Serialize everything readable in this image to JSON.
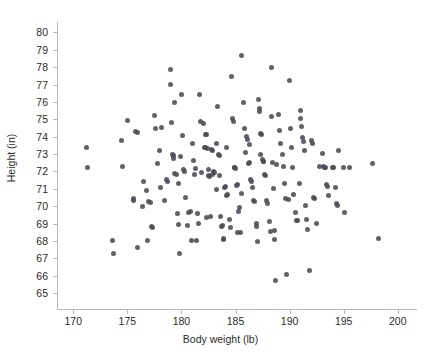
{
  "chart_data": {
    "type": "scatter",
    "title": "",
    "xlabel": "Body weight (lb)",
    "ylabel": "Height (in)",
    "xlim": [
      168.5,
      201.5
    ],
    "ylim": [
      64.2,
      80.6
    ],
    "xticks": [
      170,
      175,
      180,
      185,
      190,
      195,
      200
    ],
    "yticks": [
      65,
      66,
      67,
      68,
      69,
      70,
      71,
      72,
      73,
      74,
      75,
      76,
      77,
      78,
      79,
      80
    ],
    "grid": false,
    "legend": null,
    "marker_color": "#4b4b55",
    "axis_color": "#b9b9bd",
    "background": "#ffffff",
    "n_points": 201,
    "points": [
      [
        171.2,
        73.4
      ],
      [
        171.3,
        72.2
      ],
      [
        173.6,
        68.0
      ],
      [
        173.7,
        67.25
      ],
      [
        174.5,
        73.8
      ],
      [
        174.6,
        72.3
      ],
      [
        175.0,
        74.95
      ],
      [
        175.6,
        70.45
      ],
      [
        175.6,
        70.3
      ],
      [
        175.8,
        74.3
      ],
      [
        175.9,
        74.25
      ],
      [
        175.9,
        67.65
      ],
      [
        176.4,
        70.0
      ],
      [
        176.5,
        71.4
      ],
      [
        176.8,
        70.9
      ],
      [
        176.9,
        68.0
      ],
      [
        177.0,
        70.25
      ],
      [
        177.1,
        70.2
      ],
      [
        177.2,
        68.85
      ],
      [
        177.3,
        68.75
      ],
      [
        177.5,
        75.2
      ],
      [
        177.8,
        72.45
      ],
      [
        178.0,
        73.2
      ],
      [
        178.1,
        71.05
      ],
      [
        178.2,
        74.55
      ],
      [
        178.4,
        70.3
      ],
      [
        178.6,
        71.55
      ],
      [
        178.7,
        71.45
      ],
      [
        179.0,
        77.85
      ],
      [
        179.0,
        77.0
      ],
      [
        179.1,
        74.8
      ],
      [
        179.2,
        73.0
      ],
      [
        179.3,
        72.9
      ],
      [
        179.3,
        72.75
      ],
      [
        179.4,
        75.95
      ],
      [
        179.4,
        71.9
      ],
      [
        179.5,
        71.85
      ],
      [
        179.6,
        69.6
      ],
      [
        179.7,
        68.95
      ],
      [
        179.7,
        71.3
      ],
      [
        179.8,
        67.25
      ],
      [
        180.0,
        76.4
      ],
      [
        180.1,
        74.05
      ],
      [
        180.2,
        72.1
      ],
      [
        180.3,
        72.0
      ],
      [
        180.4,
        70.5
      ],
      [
        180.6,
        68.9
      ],
      [
        180.7,
        69.65
      ],
      [
        180.8,
        69.7
      ],
      [
        181.0,
        73.6
      ],
      [
        181.1,
        72.65
      ],
      [
        181.2,
        71.8
      ],
      [
        181.3,
        72.15
      ],
      [
        181.4,
        68.05
      ],
      [
        181.5,
        69.6
      ],
      [
        181.6,
        69.0
      ],
      [
        181.7,
        76.45
      ],
      [
        181.8,
        74.85
      ],
      [
        182.0,
        74.75
      ],
      [
        182.1,
        73.4
      ],
      [
        182.2,
        73.35
      ],
      [
        182.2,
        74.1
      ],
      [
        182.3,
        74.15
      ],
      [
        182.4,
        73.3
      ],
      [
        182.5,
        72.1
      ],
      [
        182.5,
        71.75
      ],
      [
        182.6,
        71.7
      ],
      [
        182.7,
        69.4
      ],
      [
        182.8,
        73.25
      ],
      [
        182.9,
        73.2
      ],
      [
        183.0,
        72.0
      ],
      [
        183.1,
        71.95
      ],
      [
        183.2,
        73.6
      ],
      [
        183.3,
        75.75
      ],
      [
        183.4,
        73.0
      ],
      [
        183.5,
        72.9
      ],
      [
        183.6,
        69.4
      ],
      [
        183.7,
        68.85
      ],
      [
        183.8,
        68.9
      ],
      [
        183.9,
        68.1
      ],
      [
        183.9,
        68.15
      ],
      [
        184.0,
        71.1
      ],
      [
        184.1,
        71.15
      ],
      [
        184.2,
        70.6
      ],
      [
        184.3,
        70.7
      ],
      [
        184.4,
        69.25
      ],
      [
        184.5,
        68.75
      ],
      [
        184.6,
        77.45
      ],
      [
        184.7,
        75.05
      ],
      [
        184.8,
        74.9
      ],
      [
        184.9,
        72.25
      ],
      [
        185.0,
        72.15
      ],
      [
        185.1,
        71.2
      ],
      [
        185.2,
        71.25
      ],
      [
        185.3,
        69.7
      ],
      [
        185.4,
        69.9
      ],
      [
        185.5,
        68.5
      ],
      [
        185.6,
        78.65
      ],
      [
        185.7,
        75.95
      ],
      [
        185.8,
        74.45
      ],
      [
        185.9,
        73.1
      ],
      [
        186.0,
        74.0
      ],
      [
        186.1,
        73.85
      ],
      [
        186.2,
        72.45
      ],
      [
        186.3,
        72.5
      ],
      [
        186.4,
        71.55
      ],
      [
        186.5,
        71.4
      ],
      [
        186.6,
        71.1
      ],
      [
        186.7,
        70.35
      ],
      [
        186.8,
        70.25
      ],
      [
        186.9,
        68.85
      ],
      [
        187.0,
        67.95
      ],
      [
        187.1,
        76.15
      ],
      [
        187.2,
        75.6
      ],
      [
        187.2,
        75.45
      ],
      [
        187.3,
        74.2
      ],
      [
        187.4,
        74.1
      ],
      [
        187.5,
        72.7
      ],
      [
        187.6,
        72.6
      ],
      [
        187.6,
        72.55
      ],
      [
        187.7,
        71.85
      ],
      [
        187.8,
        71.75
      ],
      [
        187.9,
        70.35
      ],
      [
        188.0,
        70.15
      ],
      [
        188.1,
        69.1
      ],
      [
        188.2,
        68.55
      ],
      [
        188.3,
        78.0
      ],
      [
        188.3,
        75.15
      ],
      [
        188.4,
        72.5
      ],
      [
        188.5,
        71.0
      ],
      [
        188.6,
        68.6
      ],
      [
        188.6,
        68.1
      ],
      [
        188.7,
        65.75
      ],
      [
        189.0,
        75.25
      ],
      [
        189.1,
        74.35
      ],
      [
        189.2,
        73.6
      ],
      [
        189.3,
        72.95
      ],
      [
        189.4,
        72.3
      ],
      [
        189.5,
        71.3
      ],
      [
        189.6,
        70.45
      ],
      [
        189.7,
        66.05
      ],
      [
        190.0,
        77.25
      ],
      [
        190.1,
        74.45
      ],
      [
        190.2,
        73.4
      ],
      [
        190.3,
        72.25
      ],
      [
        190.4,
        70.7
      ],
      [
        190.5,
        69.65
      ],
      [
        190.6,
        69.2
      ],
      [
        190.7,
        69.15
      ],
      [
        191.0,
        75.5
      ],
      [
        191.0,
        75.05
      ],
      [
        191.1,
        74.6
      ],
      [
        191.2,
        73.95
      ],
      [
        191.3,
        73.75
      ],
      [
        191.4,
        73.2
      ],
      [
        191.5,
        70.05
      ],
      [
        191.6,
        69.25
      ],
      [
        191.7,
        68.65
      ],
      [
        191.8,
        66.3
      ],
      [
        192.0,
        73.8
      ],
      [
        192.1,
        73.6
      ],
      [
        192.2,
        70.5
      ],
      [
        192.3,
        70.45
      ],
      [
        192.5,
        69.0
      ],
      [
        193.0,
        73.05
      ],
      [
        193.1,
        72.3
      ],
      [
        193.2,
        72.25
      ],
      [
        193.3,
        72.2
      ],
      [
        193.4,
        71.25
      ],
      [
        193.5,
        71.15
      ],
      [
        193.6,
        70.6
      ],
      [
        194.0,
        72.25
      ],
      [
        194.1,
        72.2
      ],
      [
        194.2,
        71.05
      ],
      [
        194.3,
        70.15
      ],
      [
        194.4,
        70.05
      ],
      [
        194.5,
        73.2
      ],
      [
        195.0,
        72.2
      ],
      [
        195.1,
        69.65
      ],
      [
        195.5,
        72.2
      ],
      [
        197.7,
        72.45
      ],
      [
        198.2,
        68.15
      ],
      [
        184.9,
        72.2
      ],
      [
        186.3,
        73.55
      ],
      [
        183.5,
        71.75
      ],
      [
        182.9,
        71.8
      ],
      [
        185.6,
        70.75
      ],
      [
        187.3,
        73.0
      ],
      [
        181.9,
        71.95
      ],
      [
        179.9,
        72.85
      ],
      [
        184.2,
        73.4
      ],
      [
        188.8,
        72.4
      ],
      [
        190.9,
        71.3
      ],
      [
        177.6,
        74.5
      ],
      [
        183.2,
        70.95
      ],
      [
        186.9,
        69.0
      ],
      [
        185.2,
        68.5
      ],
      [
        182.3,
        69.35
      ],
      [
        180.9,
        68.05
      ],
      [
        189.9,
        70.4
      ],
      [
        192.8,
        72.3
      ]
    ]
  },
  "axes": {
    "x_tick_labels": [
      "170",
      "175",
      "180",
      "185",
      "190",
      "195",
      "200"
    ],
    "y_tick_labels": [
      "65",
      "66",
      "67",
      "68",
      "69",
      "70",
      "71",
      "72",
      "73",
      "74",
      "75",
      "76",
      "77",
      "78",
      "79",
      "80"
    ],
    "x_title": "Body weight (lb)",
    "y_title": "Height (in)"
  }
}
